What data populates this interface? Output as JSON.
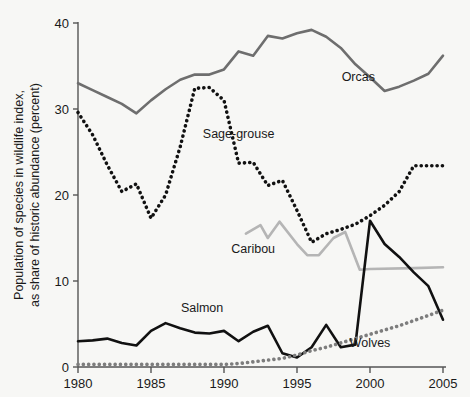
{
  "chart_data": {
    "type": "line",
    "title": "",
    "xlabel": "",
    "ylabel": "Population of species in wildlife index, as share of historic abundance (percent)",
    "ylabel_line1": "Population of species in wildlife index,",
    "ylabel_line2": "as share of historic abundance (percent)",
    "xlim": [
      1980,
      2005
    ],
    "ylim": [
      0,
      40
    ],
    "xticks": [
      1980,
      1985,
      1990,
      1995,
      2000,
      2005
    ],
    "xtick_labels": [
      "1980",
      "1985",
      "1990",
      "1995",
      "2000",
      "2005"
    ],
    "yticks": [
      0,
      10,
      20,
      30,
      40
    ],
    "ytick_labels": [
      "0",
      "10",
      "20",
      "30",
      "40"
    ],
    "grid": false,
    "legend_position": "inline-labels",
    "series": [
      {
        "name": "Orcas",
        "color": "#6e6e6e",
        "style": "solid",
        "label_x": 1999.2,
        "label_y": 33.3,
        "x": [
          1980,
          1981,
          1982,
          1983,
          1984,
          1985,
          1986,
          1987,
          1988,
          1989,
          1990,
          1991,
          1992,
          1993,
          1994,
          1995,
          1996,
          1997,
          1998,
          1999,
          2000,
          2001,
          2002,
          2003,
          2004,
          2005
        ],
        "values": [
          33.0,
          32.2,
          31.4,
          30.6,
          29.5,
          31.0,
          32.3,
          33.4,
          34.0,
          34.0,
          34.6,
          36.7,
          36.2,
          38.5,
          38.2,
          38.8,
          39.2,
          38.4,
          37.1,
          35.2,
          33.7,
          32.1,
          32.6,
          33.3,
          34.1,
          36.2
        ]
      },
      {
        "name": "Sage-grouse",
        "color": "#111111",
        "style": "dotted",
        "label_x": 1991.0,
        "label_y": 26.6,
        "x": [
          1980,
          1981,
          1982,
          1983,
          1984,
          1985,
          1986,
          1987,
          1988,
          1989,
          1990,
          1991,
          1992,
          1993,
          1994,
          1995,
          1996,
          1997,
          1998,
          1999,
          2000,
          2001,
          2002,
          2003,
          2004,
          2005
        ],
        "values": [
          29.6,
          27.0,
          23.5,
          20.4,
          21.3,
          17.3,
          20.0,
          25.6,
          32.4,
          32.5,
          31.0,
          23.7,
          23.8,
          21.1,
          21.7,
          18.2,
          14.5,
          15.5,
          16.0,
          16.6,
          17.6,
          18.8,
          20.4,
          23.4,
          23.4,
          23.4
        ]
      },
      {
        "name": "Caribou",
        "color": "#b5b5b5",
        "style": "solid",
        "label_x": 1992.0,
        "label_y": 13.2,
        "x": [
          1991.5,
          1992.5,
          1993,
          1993.8,
          1995,
          1995.7,
          1996.5,
          1997.5,
          1998.3,
          1999.3,
          2000,
          2003,
          2005
        ],
        "values": [
          15.5,
          16.5,
          15.0,
          16.9,
          14.3,
          13.0,
          13.0,
          15.0,
          15.7,
          11.3,
          11.4,
          11.5,
          11.6
        ]
      },
      {
        "name": "Salmon",
        "color": "#111111",
        "style": "solid",
        "label_x": 1988.5,
        "label_y": 6.4,
        "x": [
          1980,
          1981,
          1982,
          1983,
          1984,
          1985,
          1986,
          1987,
          1988,
          1989,
          1990,
          1991,
          1992,
          1993,
          1994,
          1995,
          1996,
          1997,
          1998,
          1999,
          2000,
          2001,
          2002,
          2003,
          2004,
          2005
        ],
        "values": [
          3.0,
          3.1,
          3.3,
          2.8,
          2.5,
          4.2,
          5.1,
          4.5,
          4.0,
          3.9,
          4.2,
          3.0,
          4.1,
          4.8,
          1.6,
          1.1,
          2.3,
          4.9,
          2.3,
          2.6,
          17.0,
          14.3,
          12.8,
          11.0,
          9.4,
          5.5
        ]
      },
      {
        "name": "Wolves",
        "color": "#7d7d7d",
        "style": "dotted",
        "label_x": 2000.0,
        "label_y": 2.3,
        "x": [
          1980,
          1985,
          1990,
          1991,
          1992,
          1993,
          1994,
          1995,
          1996,
          1997,
          1998,
          1999,
          2000,
          2001,
          2002,
          2003,
          2004,
          2005
        ],
        "values": [
          0.3,
          0.3,
          0.3,
          0.4,
          0.6,
          0.8,
          1.0,
          1.4,
          1.9,
          2.3,
          2.8,
          3.3,
          3.8,
          4.3,
          4.8,
          5.4,
          6.0,
          6.6
        ]
      }
    ]
  }
}
